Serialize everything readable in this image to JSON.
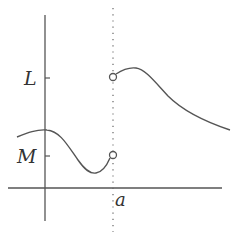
{
  "diagram": {
    "type": "function-graph-jump-discontinuity",
    "labels": {
      "y_upper": "L",
      "y_lower": "M",
      "x_point": "a"
    },
    "colors": {
      "stroke": "#555555",
      "text": "#333333",
      "background": "#ffffff"
    },
    "elements": {
      "y_axis": {
        "x": 45,
        "y1": 15,
        "y2": 221
      },
      "x_axis": {
        "y": 188,
        "x1": 8,
        "x2": 222
      },
      "dotted_line": {
        "x": 113,
        "y1": 8,
        "y2": 232
      },
      "tick_L": {
        "y": 78
      },
      "tick_M": {
        "y": 156
      },
      "open_circle_upper": {
        "cx": 113,
        "cy": 77,
        "r": 3.5
      },
      "open_circle_lower": {
        "cx": 113,
        "cy": 155,
        "r": 3.5
      }
    }
  }
}
